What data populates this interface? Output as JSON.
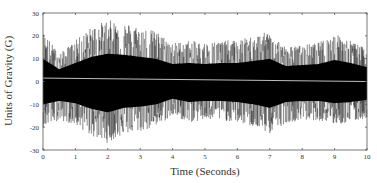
{
  "chart_data": {
    "type": "line",
    "title": "",
    "xlabel": "Time (Seconds)",
    "ylabel": "Units of Gravity (G)",
    "xlim": [
      0,
      10
    ],
    "ylim": [
      -30,
      30
    ],
    "x_ticks": [
      0,
      1,
      2,
      3,
      4,
      5,
      6,
      7,
      8,
      9,
      10
    ],
    "y_ticks": [
      30,
      20,
      10,
      0,
      -10,
      -20,
      -30
    ],
    "y_tick_labels": [
      "30",
      "20",
      "10",
      "0",
      "-10",
      "-20",
      "-30"
    ],
    "grid": false,
    "legend": null,
    "series": [
      {
        "name": "acceleration signal",
        "color": "#000000",
        "style": "dense noisy trace",
        "envelope": {
          "x": [
            0,
            0.5,
            1,
            1.5,
            2,
            2.5,
            3,
            3.5,
            4,
            4.5,
            5,
            5.5,
            6,
            6.5,
            7,
            7.5,
            8,
            8.5,
            9,
            9.5,
            10
          ],
          "upper": [
            22,
            12,
            18,
            24,
            27,
            26,
            24,
            22,
            17,
            18,
            17,
            18,
            18,
            20,
            22,
            15,
            16,
            17,
            21,
            18,
            14
          ],
          "lower": [
            -20,
            -17,
            -19,
            -24,
            -27,
            -23,
            -22,
            -20,
            -15,
            -18,
            -17,
            -17,
            -18,
            -20,
            -23,
            -18,
            -17,
            -17,
            -19,
            -18,
            -16
          ]
        }
      },
      {
        "name": "mean trend",
        "color": "#bdbdbd",
        "x": [
          0,
          10
        ],
        "y": [
          1.5,
          0
        ]
      }
    ]
  },
  "axes": {
    "xlabel": "Time (Seconds)",
    "ylabel": "Units of Gravity (G)"
  }
}
